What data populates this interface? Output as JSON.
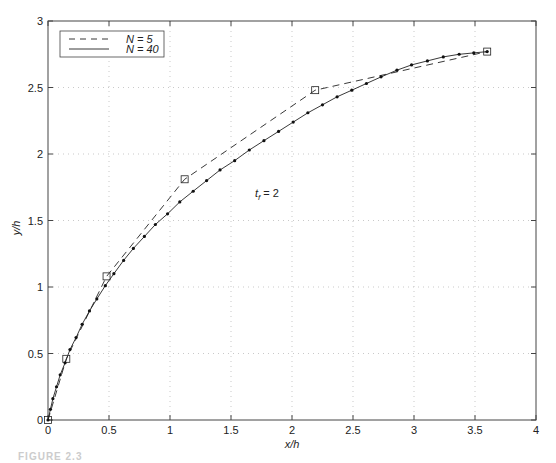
{
  "chart_data": {
    "type": "line",
    "title": "",
    "xlabel": "x/h",
    "ylabel": "y/h",
    "xlim": [
      0,
      4
    ],
    "ylim": [
      0,
      3
    ],
    "xticks": [
      "0",
      "0.5",
      "1",
      "1.5",
      "2",
      "2.5",
      "3",
      "3.5",
      "4"
    ],
    "yticks": [
      "0",
      "0.5",
      "1",
      "1.5",
      "2",
      "2.5",
      "3"
    ],
    "grid": true,
    "legend_position": "upper-left",
    "annotation": {
      "text_base": "t",
      "text_sub": "f",
      "text_rest": " = 2",
      "x": 1.55,
      "y": 1.6
    },
    "series": [
      {
        "name": "N = 5",
        "style": "dashed",
        "marker": "square",
        "x": [
          0,
          0.15,
          0.48,
          1.12,
          2.19,
          3.6
        ],
        "y": [
          0,
          0.46,
          1.08,
          1.81,
          2.48,
          2.77
        ]
      },
      {
        "name": "N = 40",
        "style": "solid",
        "marker": "dot",
        "x": [
          0,
          0.02,
          0.04,
          0.07,
          0.1,
          0.14,
          0.18,
          0.23,
          0.28,
          0.34,
          0.4,
          0.47,
          0.54,
          0.62,
          0.7,
          0.79,
          0.88,
          0.98,
          1.08,
          1.19,
          1.3,
          1.41,
          1.53,
          1.65,
          1.77,
          1.89,
          2.01,
          2.13,
          2.25,
          2.37,
          2.49,
          2.61,
          2.73,
          2.86,
          2.98,
          3.11,
          3.24,
          3.37,
          3.49,
          3.6
        ],
        "y": [
          0,
          0.08,
          0.16,
          0.25,
          0.34,
          0.43,
          0.53,
          0.62,
          0.72,
          0.82,
          0.91,
          1.01,
          1.1,
          1.2,
          1.29,
          1.38,
          1.47,
          1.55,
          1.64,
          1.72,
          1.8,
          1.88,
          1.95,
          2.03,
          2.1,
          2.17,
          2.24,
          2.31,
          2.37,
          2.43,
          2.48,
          2.53,
          2.58,
          2.63,
          2.67,
          2.7,
          2.73,
          2.75,
          2.76,
          2.77
        ]
      }
    ]
  },
  "legend": {
    "n5_label": "N = 5",
    "n40_label": "N = 40"
  },
  "caption": "FIGURE 2.3"
}
